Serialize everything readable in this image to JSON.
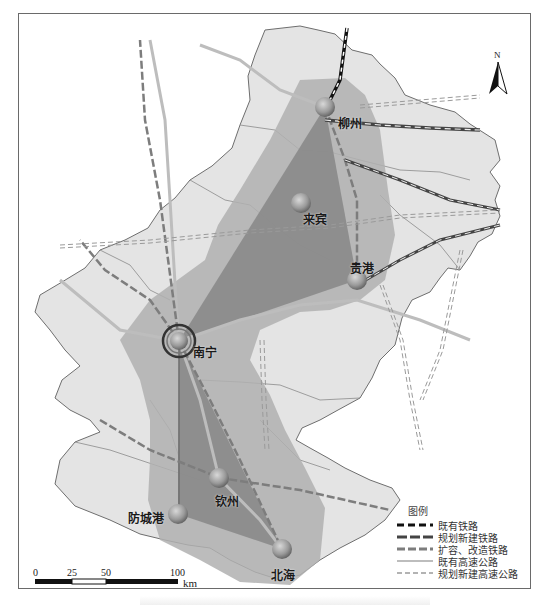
{
  "map": {
    "north_label": "N",
    "colors": {
      "land": "#e4e4e4",
      "border": "#6e6e6e",
      "envelope": "#b0b0b0",
      "triangle": "#8a8a8a",
      "node": "#9a9a9a"
    },
    "cities": [
      {
        "id": "nanning",
        "name": "南宁",
        "x": 179,
        "y": 341,
        "hub": true
      },
      {
        "id": "liuzhou",
        "name": "柳州",
        "x": 325,
        "y": 107,
        "hub": false
      },
      {
        "id": "laibin",
        "name": "来宾",
        "x": 301,
        "y": 203,
        "hub": false
      },
      {
        "id": "guigang",
        "name": "贵港",
        "x": 357,
        "y": 280,
        "hub": false
      },
      {
        "id": "qinzhou",
        "name": "钦州",
        "x": 219,
        "y": 478,
        "hub": false
      },
      {
        "id": "fangchenggang",
        "name": "防城港",
        "x": 178,
        "y": 514,
        "hub": false
      },
      {
        "id": "beihai",
        "name": "北海",
        "x": 282,
        "y": 549,
        "hub": false
      }
    ]
  },
  "legend": {
    "title": "图例",
    "items": [
      {
        "label": "既有铁路",
        "style": "existing-rail"
      },
      {
        "label": "规划新建铁路",
        "style": "planned-rail"
      },
      {
        "label": "扩容、改造铁路",
        "style": "upgrade-rail"
      },
      {
        "label": "既有高速公路",
        "style": "existing-highway"
      },
      {
        "label": "规划新建高速公路",
        "style": "planned-highway"
      }
    ]
  },
  "scale": {
    "ticks": [
      "0",
      "25",
      "50",
      "100"
    ],
    "unit": "km"
  }
}
